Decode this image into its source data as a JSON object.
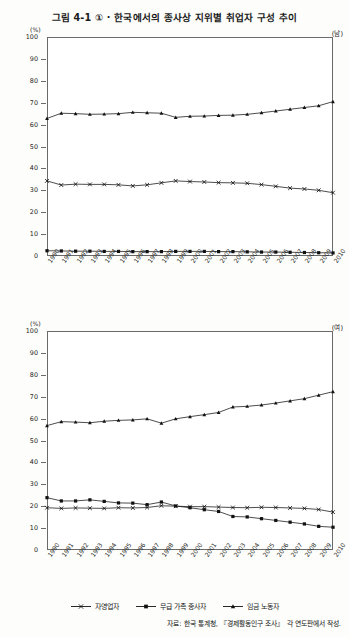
{
  "figure": {
    "title": "그림 4-1 ① · 한국에서의 종사상 지위별 취업자 구성 추이",
    "unit_label": "(%)",
    "source_note": "자료: 한국 통계청, 『경제활동인구 조사』 각 연도판에서 작성."
  },
  "panels": [
    {
      "tag": "(남)",
      "unit": "(%)"
    },
    {
      "tag": "(여)",
      "unit": "(%)"
    }
  ],
  "legend": {
    "items": [
      {
        "label": "자영업자",
        "marker": "x-marker",
        "color": "#111111"
      },
      {
        "label": "무급 가족 종사자",
        "marker": "square-marker",
        "color": "#111111"
      },
      {
        "label": "임금 노동자",
        "marker": "triangle-marker",
        "color": "#111111"
      }
    ]
  },
  "yticks": [
    0,
    10,
    20,
    30,
    40,
    50,
    60,
    70,
    80,
    90,
    100
  ],
  "xticks": [
    "1990",
    "1991",
    "1992",
    "1993",
    "1994",
    "1995",
    "1996",
    "1997",
    "1998",
    "1999",
    "2000",
    "2001",
    "2002",
    "2003",
    "2004",
    "2005",
    "2006",
    "2007",
    "2008",
    "2009",
    "2010"
  ],
  "chart_data": [
    {
      "type": "line",
      "title": "그림 4-1 ① · 한국에서의 종사상 지위별 취업자 구성 추이",
      "subtitle": "(남)",
      "xlabel": "",
      "ylabel": "(%)",
      "ylim": [
        0,
        100
      ],
      "grid": false,
      "legend_position": "bottom",
      "x": [
        "1990",
        "1991",
        "1992",
        "1993",
        "1994",
        "1995",
        "1996",
        "1997",
        "1998",
        "1999",
        "2000",
        "2001",
        "2002",
        "2003",
        "2004",
        "2005",
        "2006",
        "2007",
        "2008",
        "2009",
        "2010"
      ],
      "series": [
        {
          "name": "임금 노동자",
          "marker": "triangle",
          "values": [
            62.8,
            65.2,
            65.0,
            64.7,
            64.8,
            65.0,
            65.6,
            65.4,
            65.2,
            63.3,
            63.8,
            63.9,
            64.2,
            64.3,
            64.7,
            65.4,
            66.2,
            67.0,
            67.8,
            68.6,
            70.5
          ]
        },
        {
          "name": "자영업자",
          "marker": "x",
          "values": [
            34.3,
            32.4,
            32.8,
            32.7,
            32.7,
            32.5,
            32.0,
            32.5,
            33.4,
            34.3,
            34.0,
            33.8,
            33.5,
            33.4,
            33.2,
            32.6,
            31.8,
            31.0,
            30.6,
            30.0,
            28.9
          ]
        },
        {
          "name": "무급 가족 종사자",
          "marker": "square",
          "values": [
            2.4,
            2.3,
            2.2,
            2.2,
            2.1,
            2.1,
            2.0,
            2.0,
            2.0,
            2.1,
            2.1,
            2.1,
            2.0,
            2.0,
            1.9,
            1.8,
            1.8,
            1.7,
            1.6,
            1.5,
            1.4
          ]
        }
      ]
    },
    {
      "type": "line",
      "subtitle": "(여)",
      "xlabel": "",
      "ylabel": "(%)",
      "ylim": [
        0,
        100
      ],
      "grid": false,
      "legend_position": "bottom",
      "x": [
        "1990",
        "1991",
        "1992",
        "1993",
        "1994",
        "1995",
        "1996",
        "1997",
        "1998",
        "1999",
        "2000",
        "2001",
        "2002",
        "2003",
        "2004",
        "2005",
        "2006",
        "2007",
        "2008",
        "2009",
        "2010"
      ],
      "series": [
        {
          "name": "임금 노동자",
          "marker": "triangle",
          "values": [
            56.8,
            58.6,
            58.4,
            58.1,
            58.8,
            59.2,
            59.4,
            59.9,
            57.9,
            59.9,
            60.9,
            61.8,
            62.8,
            65.3,
            65.6,
            66.2,
            67.1,
            68.1,
            69.1,
            70.7,
            72.3
          ]
        },
        {
          "name": "자영업자",
          "marker": "x",
          "values": [
            19.3,
            19.0,
            19.2,
            19.1,
            19.0,
            19.3,
            19.2,
            19.4,
            20.2,
            20.0,
            19.8,
            19.8,
            19.6,
            19.4,
            19.3,
            19.5,
            19.4,
            19.2,
            19.0,
            18.5,
            17.3
          ]
        },
        {
          "name": "무급 가족 종사자",
          "marker": "square",
          "values": [
            23.9,
            22.4,
            22.4,
            22.9,
            22.2,
            21.5,
            21.4,
            20.7,
            21.9,
            20.1,
            19.3,
            18.4,
            17.6,
            15.3,
            15.1,
            14.3,
            13.5,
            12.7,
            11.9,
            10.8,
            10.4
          ]
        }
      ]
    }
  ]
}
